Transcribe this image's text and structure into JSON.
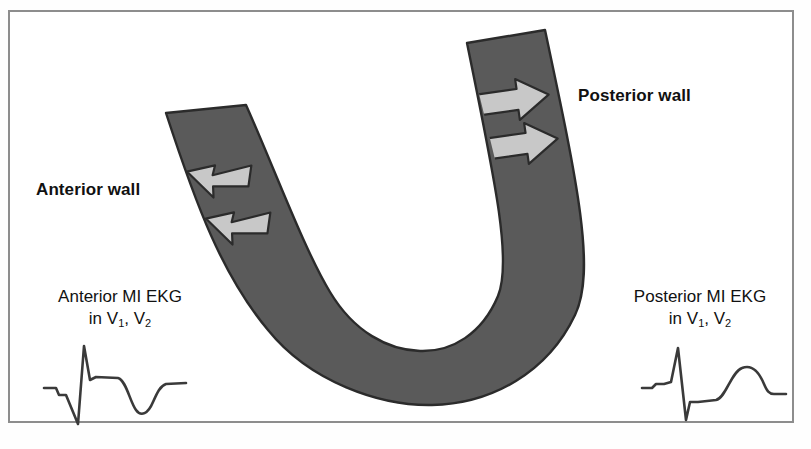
{
  "figure": {
    "background_color": "#ffffff",
    "frame_color": "#8d8d8d"
  },
  "colors": {
    "myocardium_fill": "#5a5a5a",
    "myocardium_outline": "#2b2b2b",
    "arrow_fill": "#c8c8c8",
    "arrow_outline": "#2b2b2b",
    "text": "#111111",
    "trace": "#3a3a3a"
  },
  "labels": {
    "anterior_wall": "Anterior wall",
    "posterior_wall": "Posterior wall"
  },
  "ekg_panels": [
    {
      "id": "anterior",
      "caption_line1": "Anterior MI EKG",
      "caption_line2_prefix": "in V",
      "caption_lead1": "1",
      "caption_separator": ", V",
      "caption_lead2": "2",
      "pattern": "tall R wave, deep QS, elevated ST, inverted T wave"
    },
    {
      "id": "posterior",
      "caption_line1": "Posterior MI EKG",
      "caption_line2_prefix": "in V",
      "caption_lead1": "1",
      "caption_separator": ", V",
      "caption_lead2": "2",
      "pattern": "tall R wave, depressed ST, upright rounded T wave"
    }
  ],
  "arrows": {
    "anterior_count": 2,
    "posterior_count": 2,
    "anterior_direction": "left",
    "posterior_direction": "right"
  },
  "bleed_text": ""
}
